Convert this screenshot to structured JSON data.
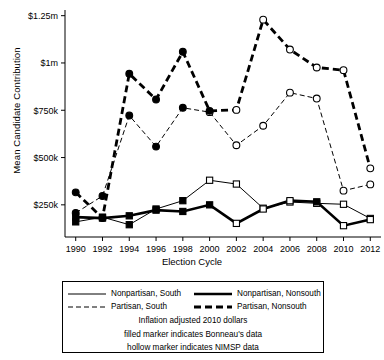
{
  "chart_data": {
    "type": "line",
    "title": "",
    "xlabel": "Election Cycle",
    "ylabel": "Mean Candidate Contribution",
    "categories": [
      1990,
      1992,
      1994,
      1996,
      1998,
      2000,
      2002,
      2004,
      2006,
      2008,
      2010,
      2012
    ],
    "xticklabels": [
      "1990",
      "1992",
      "1994",
      "1996",
      "1998",
      "2000",
      "2002",
      "2004",
      "2006",
      "2008",
      "2010",
      "2012"
    ],
    "yticklabels": [
      "$250k",
      "$500k",
      "$750k",
      "$1m",
      "$1.25m"
    ],
    "ytickvalues": [
      250000,
      500000,
      750000,
      1000000,
      1250000
    ],
    "ylim": [
      80000,
      1280000
    ],
    "xlim": [
      1989.2,
      2012.8
    ],
    "grid": false,
    "legend_position": "below-axes",
    "marker_note": "filled marker = Bonneau's data; hollow marker = NIMSP data",
    "series": [
      {
        "name": "Nonpartisan, South",
        "style": "thin-solid",
        "marker": "square",
        "points": [
          {
            "x": 1990,
            "y": 160000,
            "marker": "filled"
          },
          {
            "x": 1992,
            "y": 185000,
            "marker": "filled"
          },
          {
            "x": 1994,
            "y": 145000,
            "marker": "filled"
          },
          {
            "x": 1996,
            "y": 228000,
            "marker": "filled"
          },
          {
            "x": 1998,
            "y": 272000,
            "marker": "filled"
          },
          {
            "x": 2000,
            "y": 380000,
            "marker": "hollow"
          },
          {
            "x": 2002,
            "y": 360000,
            "marker": "hollow"
          },
          {
            "x": 2004,
            "y": 232000,
            "marker": "hollow"
          },
          {
            "x": 2006,
            "y": 265000,
            "marker": "hollow"
          },
          {
            "x": 2008,
            "y": 258000,
            "marker": "hollow"
          },
          {
            "x": 2010,
            "y": 253000,
            "marker": "hollow"
          },
          {
            "x": 2012,
            "y": 178000,
            "marker": "hollow"
          }
        ]
      },
      {
        "name": "Nonpartisan, Nonsouth",
        "style": "thick-solid",
        "marker": "square",
        "points": [
          {
            "x": 1990,
            "y": 185000,
            "marker": "filled"
          },
          {
            "x": 1992,
            "y": 180000,
            "marker": "filled"
          },
          {
            "x": 1994,
            "y": 192000,
            "marker": "filled"
          },
          {
            "x": 1996,
            "y": 222000,
            "marker": "filled"
          },
          {
            "x": 1998,
            "y": 215000,
            "marker": "filled"
          },
          {
            "x": 2000,
            "y": 250000,
            "marker": "filled"
          },
          {
            "x": 2002,
            "y": 152000,
            "marker": "hollow"
          },
          {
            "x": 2004,
            "y": 228000,
            "marker": "hollow"
          },
          {
            "x": 2006,
            "y": 272000,
            "marker": "hollow"
          },
          {
            "x": 2008,
            "y": 266000,
            "marker": "filled"
          },
          {
            "x": 2010,
            "y": 140000,
            "marker": "hollow"
          },
          {
            "x": 2012,
            "y": 172000,
            "marker": "hollow"
          }
        ]
      },
      {
        "name": "Partisan, South",
        "style": "thin-dashed",
        "marker": "circle",
        "points": [
          {
            "x": 1990,
            "y": 207000,
            "marker": "filled"
          },
          {
            "x": 1992,
            "y": 297000,
            "marker": "filled"
          },
          {
            "x": 1994,
            "y": 722000,
            "marker": "filled"
          },
          {
            "x": 1996,
            "y": 558000,
            "marker": "filled"
          },
          {
            "x": 1998,
            "y": 763000,
            "marker": "filled"
          },
          {
            "x": 2000,
            "y": 740000,
            "marker": "hollow"
          },
          {
            "x": 2002,
            "y": 565000,
            "marker": "hollow"
          },
          {
            "x": 2004,
            "y": 668000,
            "marker": "hollow"
          },
          {
            "x": 2006,
            "y": 843000,
            "marker": "hollow"
          },
          {
            "x": 2008,
            "y": 812000,
            "marker": "hollow"
          },
          {
            "x": 2010,
            "y": 325000,
            "marker": "hollow"
          },
          {
            "x": 2012,
            "y": 358000,
            "marker": "hollow"
          }
        ]
      },
      {
        "name": "Partisan, Nonsouth",
        "style": "thick-dashed",
        "marker": "circle",
        "points": [
          {
            "x": 1990,
            "y": 316000,
            "marker": "filled"
          },
          {
            "x": 1992,
            "y": 180000,
            "marker": "filled"
          },
          {
            "x": 1994,
            "y": 943000,
            "marker": "filled"
          },
          {
            "x": 1996,
            "y": 807000,
            "marker": "filled"
          },
          {
            "x": 1998,
            "y": 1059000,
            "marker": "filled"
          },
          {
            "x": 2000,
            "y": 747000,
            "marker": "filled"
          },
          {
            "x": 2002,
            "y": 752000,
            "marker": "hollow"
          },
          {
            "x": 2004,
            "y": 1229000,
            "marker": "hollow"
          },
          {
            "x": 2006,
            "y": 1071000,
            "marker": "hollow"
          },
          {
            "x": 2008,
            "y": 976000,
            "marker": "hollow"
          },
          {
            "x": 2010,
            "y": 962000,
            "marker": "hollow"
          },
          {
            "x": 2012,
            "y": 443000,
            "marker": "hollow"
          }
        ]
      }
    ]
  },
  "legend": {
    "items": [
      {
        "label": "Nonpartisan, South",
        "style": "thin-solid"
      },
      {
        "label": "Nonpartisan, Nonsouth",
        "style": "thick-solid"
      },
      {
        "label": "Partisan, South",
        "style": "thin-dashed"
      },
      {
        "label": "Partisan, Nonsouth",
        "style": "thick-dashed"
      }
    ],
    "notes": [
      "Inflation adjusted 2010 dollars",
      "filled marker indicates Bonneau's data",
      "hollow marker indicates NIMSP data"
    ]
  }
}
